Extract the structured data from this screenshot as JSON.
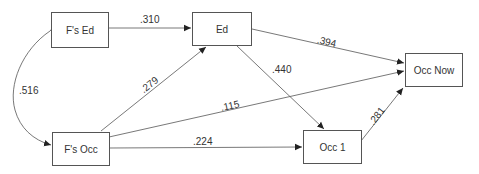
{
  "diagram": {
    "type": "path-diagram",
    "nodes": [
      {
        "id": "fs_ed",
        "label": "F's Ed"
      },
      {
        "id": "ed",
        "label": "Ed"
      },
      {
        "id": "occ_now",
        "label": "Occ Now"
      },
      {
        "id": "fs_occ",
        "label": "F's Occ"
      },
      {
        "id": "occ1",
        "label": "Occ 1"
      }
    ],
    "edges": [
      {
        "from": "fs_ed",
        "to": "ed",
        "coef": ".310"
      },
      {
        "from": "ed",
        "to": "occ_now",
        "coef": ".394"
      },
      {
        "from": "ed",
        "to": "occ1",
        "coef": ".440"
      },
      {
        "from": "fs_occ",
        "to": "ed",
        "coef": ".279"
      },
      {
        "from": "fs_occ",
        "to": "occ_now",
        "coef": ".115"
      },
      {
        "from": "fs_occ",
        "to": "occ1",
        "coef": ".224"
      },
      {
        "from": "occ1",
        "to": "occ_now",
        "coef": ".281"
      },
      {
        "from": "fs_ed",
        "to": "fs_occ",
        "coef": ".516",
        "bidirectional": true
      }
    ]
  }
}
